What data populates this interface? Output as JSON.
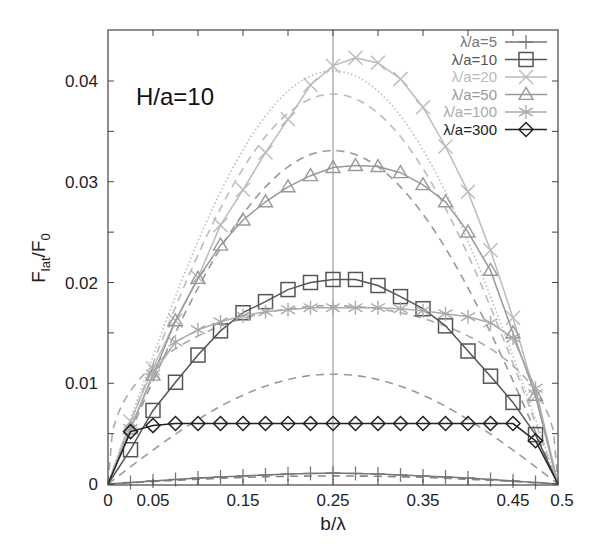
{
  "chart_data": {
    "type": "line",
    "title": "",
    "annotation": "H/a=10",
    "xlabel": "b/λ",
    "ylabel_main": "F",
    "ylabel_sub1": "lat",
    "ylabel_mid": "/F",
    "ylabel_sub2": "0",
    "xlim": [
      0,
      0.5
    ],
    "ylim": [
      0,
      0.0448
    ],
    "grid": false,
    "legend_position": "top-right",
    "x_ticks": [
      0,
      0.05,
      0.15,
      0.25,
      0.35,
      0.45,
      0.5
    ],
    "x_tick_labels": [
      "0",
      "0.05",
      "0.15",
      "0.25",
      "0.35",
      "0.45",
      "0.5"
    ],
    "x_minor_ticks": [
      0.05,
      0.1,
      0.15,
      0.2,
      0.25,
      0.3,
      0.35,
      0.4,
      0.45
    ],
    "y_ticks": [
      0,
      0.01,
      0.02,
      0.03,
      0.04
    ],
    "y_tick_labels": [
      "0",
      "0.01",
      "0.02",
      "0.03",
      "0.04"
    ],
    "y_minor_ticks": [
      0.005,
      0.015,
      0.025,
      0.035
    ],
    "vertical_reference_line": 0.25,
    "x": [
      0,
      0.025,
      0.05,
      0.075,
      0.1,
      0.125,
      0.15,
      0.175,
      0.2,
      0.225,
      0.25,
      0.275,
      0.3,
      0.325,
      0.35,
      0.375,
      0.4,
      0.425,
      0.45,
      0.475,
      0.5
    ],
    "series": [
      {
        "name": "λ/a=5",
        "marker": "plus",
        "color": "#777777",
        "line": "solid",
        "values": [
          0,
          0.00015,
          0.0003,
          0.00045,
          0.0006,
          0.0007,
          0.0008,
          0.0009,
          0.001,
          0.00105,
          0.0011,
          0.00105,
          0.001,
          0.0009,
          0.0008,
          0.0007,
          0.0006,
          0.00045,
          0.0003,
          0.00015,
          0
        ]
      },
      {
        "name": "λ/a=10",
        "marker": "square",
        "color": "#555555",
        "line": "solid",
        "values": [
          0,
          0.0034,
          0.0073,
          0.0101,
          0.0128,
          0.0152,
          0.017,
          0.0181,
          0.0193,
          0.02,
          0.0203,
          0.0203,
          0.0197,
          0.0186,
          0.0174,
          0.0157,
          0.0132,
          0.0107,
          0.0081,
          0.0049,
          0
        ]
      },
      {
        "name": "λ/a=20",
        "marker": "cross",
        "color": "#bbbbbb",
        "line": "solid",
        "values": [
          0,
          0.0062,
          0.0115,
          0.0162,
          0.0205,
          0.0257,
          0.0292,
          0.0329,
          0.0362,
          0.0396,
          0.0415,
          0.0423,
          0.0418,
          0.0402,
          0.0374,
          0.0335,
          0.029,
          0.0232,
          0.0165,
          0.0087,
          0
        ]
      },
      {
        "name": "λ/a=50",
        "marker": "triangle",
        "color": "#999999",
        "line": "solid",
        "values": [
          0,
          0.0055,
          0.0108,
          0.0162,
          0.0204,
          0.0237,
          0.0262,
          0.028,
          0.0295,
          0.0306,
          0.0314,
          0.0316,
          0.0315,
          0.0309,
          0.0297,
          0.028,
          0.025,
          0.0212,
          0.015,
          0.0088,
          0
        ]
      },
      {
        "name": "λ/a=100",
        "marker": "star",
        "color": "#aaaaaa",
        "line": "solid",
        "values": [
          0,
          0.0055,
          0.0109,
          0.0141,
          0.0153,
          0.0161,
          0.0167,
          0.0171,
          0.0173,
          0.0175,
          0.0175,
          0.0175,
          0.0175,
          0.0174,
          0.0172,
          0.0169,
          0.0166,
          0.016,
          0.0145,
          0.0095,
          0
        ]
      },
      {
        "name": "λ/a=300",
        "marker": "diamond",
        "color": "#222222",
        "line": "solid",
        "values": [
          0,
          0.0052,
          0.0058,
          0.006,
          0.006,
          0.006,
          0.006,
          0.006,
          0.006,
          0.006,
          0.006,
          0.006,
          0.006,
          0.006,
          0.006,
          0.006,
          0.006,
          0.006,
          0.006,
          0.0043,
          0
        ]
      }
    ],
    "model_curves": [
      {
        "style": "dashed",
        "color": "#999999",
        "peak": 0.0109,
        "peak_x": 0.25
      },
      {
        "style": "dashed",
        "color": "#999999",
        "peak": 0.0331,
        "peak_x": 0.25
      },
      {
        "style": "dashed",
        "color": "#bbbbbb",
        "peak": 0.0387,
        "peak_x": 0.25
      },
      {
        "style": "dotted",
        "color": "#bbbbbb",
        "peak": 0.041,
        "peak_x": 0.25
      },
      {
        "style": "dashed",
        "color": "#aaaaaa",
        "peak": 0.0177,
        "peak_x": 0.25,
        "flat": true
      },
      {
        "style": "dashed",
        "color": "#888888",
        "peak": 0.0008,
        "peak_x": 0.25
      }
    ]
  }
}
